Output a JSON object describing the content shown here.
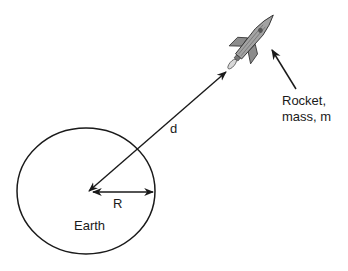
{
  "diagram": {
    "labels": {
      "distance": "d",
      "radius": "R",
      "earth": "Earth",
      "rocket_line1": "Rocket,",
      "rocket_line2": "mass, m"
    },
    "colors": {
      "stroke": "#1a1a1a",
      "rocket_body": "#9a9a9a",
      "rocket_shade": "#6e6e6e",
      "background": "#ffffff"
    }
  }
}
